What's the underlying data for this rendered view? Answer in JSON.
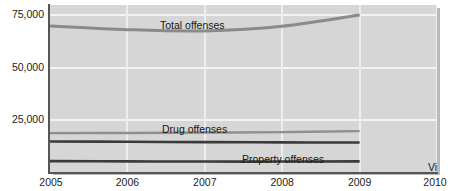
{
  "chart_data": {
    "type": "line",
    "title": "",
    "subtitle": "",
    "xlabel": "",
    "ylabel": "",
    "xlim": [
      2005,
      2010
    ],
    "ylim": [
      0,
      80000
    ],
    "yticks": [
      25000,
      50000,
      75000
    ],
    "ytick_labels": [
      "25,000",
      "50,000",
      "75,000"
    ],
    "xticks": [
      2005,
      2006,
      2007,
      2008,
      2009,
      2010
    ],
    "xtick_labels": [
      "2005",
      "2006",
      "2007",
      "2008",
      "2009",
      "2010"
    ],
    "grid": true,
    "legend": "inline-labels",
    "x": [
      2005,
      2006,
      2007,
      2008,
      2009
    ],
    "series": [
      {
        "name": "Total offenses",
        "color": "#8a8a8a",
        "width": 3.0,
        "values": [
          70000,
          68200,
          67600,
          69800,
          75200
        ]
      },
      {
        "name": "Drug offenses",
        "color": "#8f8f8f",
        "width": 2.4,
        "values": [
          18600,
          18700,
          18900,
          19100,
          19600
        ]
      },
      {
        "name": "Property offenses",
        "color": "#3a3a3a",
        "width": 2.6,
        "values": [
          14600,
          14500,
          14300,
          14200,
          14100
        ]
      },
      {
        "name": "Violent offenses",
        "color": "#3a3a3a",
        "width": 2.6,
        "values": [
          5200,
          5100,
          5000,
          5000,
          5100
        ]
      }
    ],
    "annotations": [
      {
        "text": "Total offenses",
        "series": "Total offenses"
      },
      {
        "text": "Drug offenses",
        "series": "Drug offenses"
      },
      {
        "text": "Property offenses",
        "series": "Property offenses"
      },
      {
        "text": "Violent offenses",
        "series": "Violent offenses"
      }
    ]
  },
  "colors": {
    "plot_background": "#d6d6d6",
    "gridline": "#f2f2f2",
    "axis": "#555555",
    "text": "#1c1c1c",
    "shadow": "#b9b9b9"
  }
}
